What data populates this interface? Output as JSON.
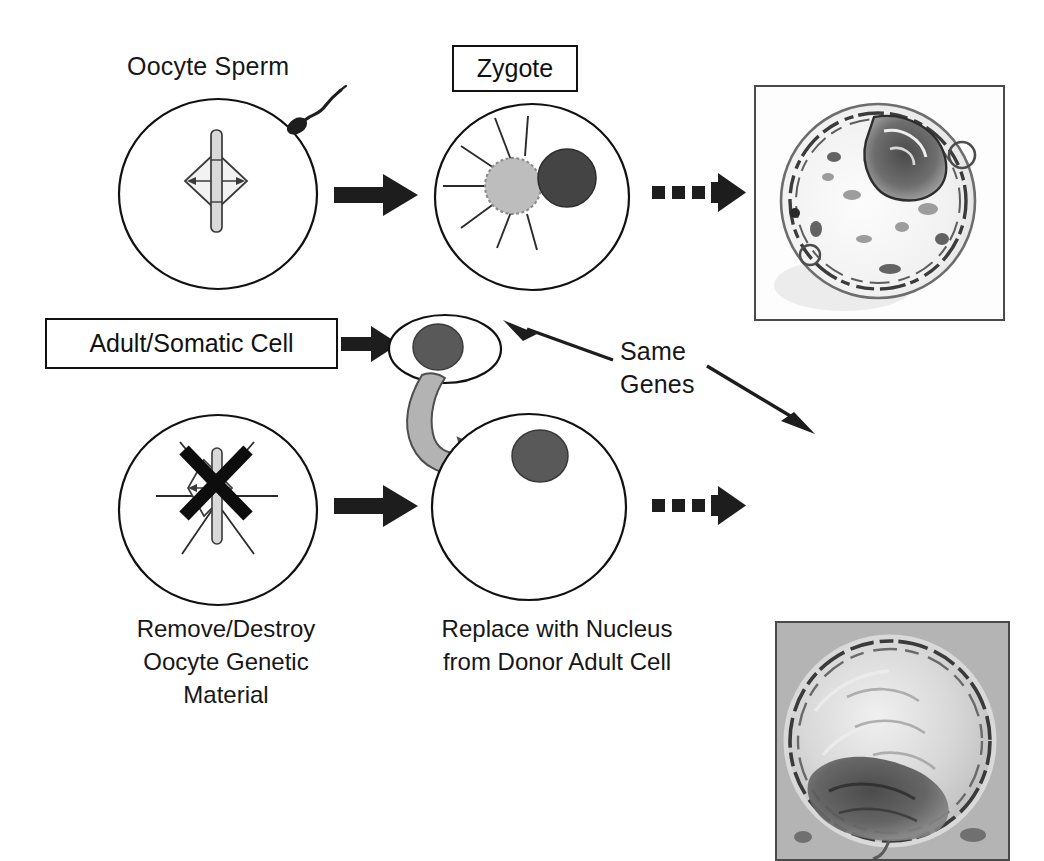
{
  "diagram": {
    "labels": {
      "oocyte_sperm": "Oocyte Sperm",
      "zygote": "Zygote",
      "adult_somatic_cell": "Adult/Somatic Cell",
      "same_genes_line1": "Same",
      "same_genes_line2": "Genes"
    },
    "captions": {
      "left_line1": "Remove/Destroy",
      "left_line2": "Oocyte Genetic",
      "left_line3": "Material",
      "right_line1": "Replace with Nucleus",
      "right_line2": "from  Donor Adult  Cell"
    },
    "micrographs": [
      {
        "name": "fertilized-blastocyst",
        "background": "white",
        "description": "Blastocyst with dark inner cell mass at upper right"
      },
      {
        "name": "cloned-blastocyst",
        "background": "gray",
        "description": "Blastocyst with dark inner cell mass at lower left"
      }
    ],
    "colors": {
      "outline": "#111111",
      "arrow_solid": "#1d1d1d",
      "nucleus_dark": "#595959",
      "pronucleus_light": "#bdbdbd",
      "pronucleus_dark": "#444444",
      "transfer_arrow": "#b3b3b3",
      "micrograph_frame": "#4a4a4a"
    }
  }
}
